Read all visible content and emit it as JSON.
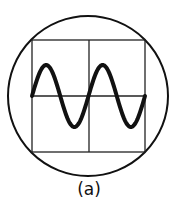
{
  "figure": {
    "label": "(a)",
    "screen": {
      "cx": 88,
      "cy": 96,
      "r": 80
    },
    "grid": {
      "x0": 32,
      "y0": 40,
      "x1": 145,
      "y1": 152,
      "divisions_x": 2,
      "divisions_y": 2
    },
    "waveform": {
      "type": "sine",
      "cycles": 2,
      "amplitude_px": 31,
      "start_phase": 0
    },
    "colors": {
      "stroke": "#111111",
      "background": "#ffffff"
    }
  }
}
